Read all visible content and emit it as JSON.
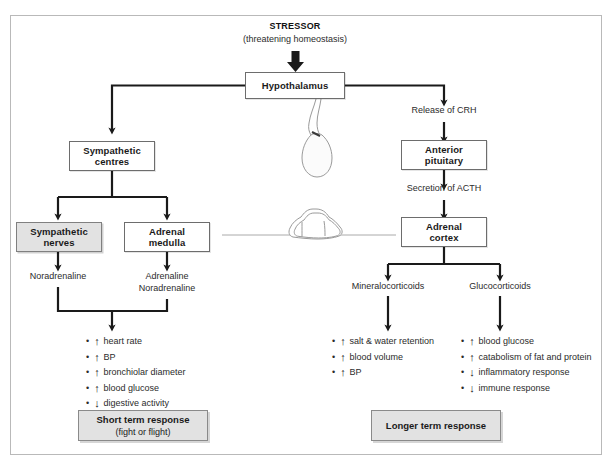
{
  "diagram": {
    "stressor": {
      "title": "STRESSOR",
      "subtitle": "(threatening homeostasis)"
    },
    "nodes": {
      "hypothalamus": "Hypothalamus",
      "sympathetic_centres": "Sympathetic\ncentres",
      "sympathetic_centres_l1": "Sympathetic",
      "sympathetic_centres_l2": "centres",
      "sympathetic_nerves_l1": "Sympathetic",
      "sympathetic_nerves_l2": "nerves",
      "adrenal_medulla_l1": "Adrenal",
      "adrenal_medulla_l2": "medulla",
      "anterior_pituitary_l1": "Anterior",
      "anterior_pituitary_l2": "pituitary",
      "adrenal_cortex_l1": "Adrenal",
      "adrenal_cortex_l2": "cortex"
    },
    "edge_labels": {
      "release_crh": "Release of CRH",
      "secretion_acth": "Secretion of ACTH",
      "noradrenaline": "Noradrenaline",
      "adrenaline": "Adrenaline",
      "noradrenaline2": "Noradrenaline",
      "mineralocorticoids": "Mineralocorticoids",
      "glucocorticoids": "Glucocorticoids"
    },
    "effects": {
      "sympathetic": [
        {
          "dir": "up",
          "text": "heart rate"
        },
        {
          "dir": "up",
          "text": "BP"
        },
        {
          "dir": "up",
          "text": "bronchiolar diameter"
        },
        {
          "dir": "up",
          "text": "blood glucose"
        },
        {
          "dir": "down",
          "text": "digestive activity"
        }
      ],
      "mineralocorticoid": [
        {
          "dir": "up",
          "text": "salt & water retention"
        },
        {
          "dir": "up",
          "text": "blood volume"
        },
        {
          "dir": "up",
          "text": "BP"
        }
      ],
      "glucocorticoid": [
        {
          "dir": "up",
          "text": "blood glucose"
        },
        {
          "dir": "up",
          "text": "catabolism of fat and protein"
        },
        {
          "dir": "down",
          "text": "inflammatory response"
        },
        {
          "dir": "down",
          "text": "immune response"
        }
      ]
    },
    "responses": {
      "short_l1": "Short term response",
      "short_l2": "(fight or flight)",
      "long_l1": "Longer term response"
    },
    "glyphs": {
      "bullet": "•",
      "up": "↑",
      "down": "↓"
    },
    "colors": {
      "shade": "#e2e2e2",
      "line": "#1a1a1a",
      "border": "#6d6d6d",
      "frame": "#b9b9b9",
      "sketch": "#9a9a9a"
    },
    "anatomy": {
      "pituitary_sketch": "pituitary-gland-sketch",
      "adrenal_sketch": "adrenal-gland-sketch"
    }
  }
}
